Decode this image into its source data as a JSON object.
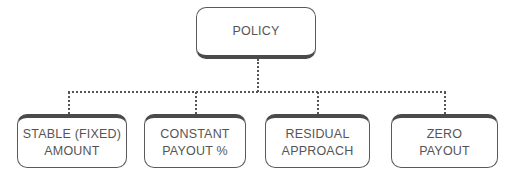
{
  "diagram": {
    "root": {
      "label": "POLICY"
    },
    "children": [
      {
        "label": "STABLE (FIXED)\nAMOUNT"
      },
      {
        "label": "CONSTANT\nPAYOUT %"
      },
      {
        "label": "RESIDUAL\nAPPROACH"
      },
      {
        "label": "ZERO\nPAYOUT"
      }
    ]
  }
}
